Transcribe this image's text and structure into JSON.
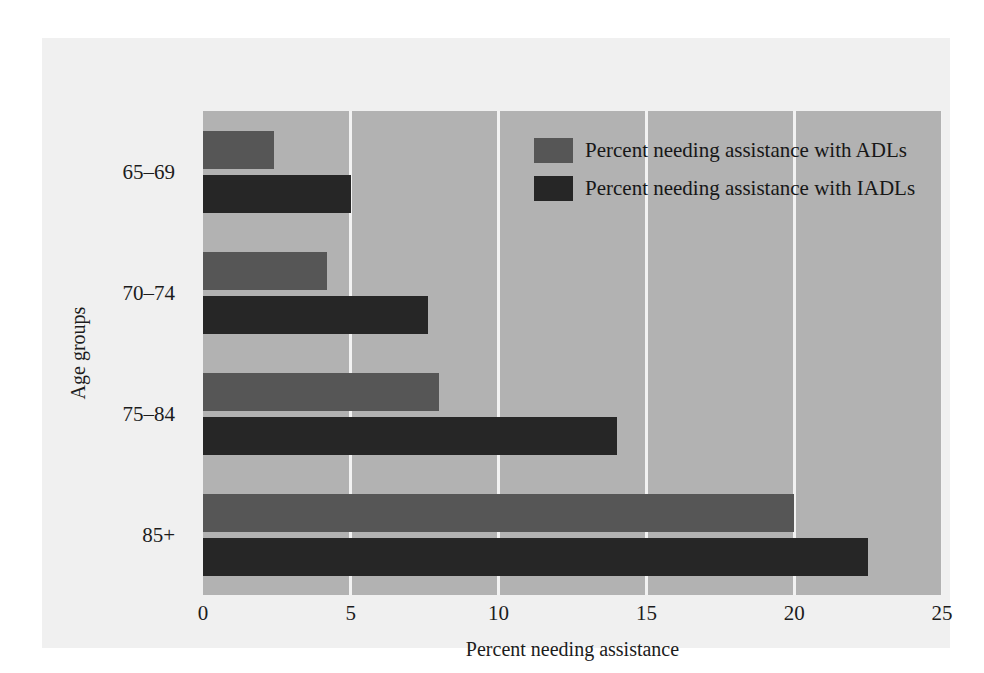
{
  "chart_data": {
    "type": "bar",
    "orientation": "horizontal",
    "title": "",
    "xlabel": "Percent needing assistance",
    "ylabel": "Age groups",
    "categories": [
      "65–69",
      "70–74",
      "75–84",
      "85+"
    ],
    "series": [
      {
        "name": "Percent needing assistance with ADLs",
        "color": "#565656",
        "values": [
          2.4,
          4.2,
          8.0,
          20.0
        ]
      },
      {
        "name": "Percent needing assistance with IADLs",
        "color": "#262626",
        "values": [
          5.0,
          7.6,
          14.0,
          22.5
        ]
      }
    ],
    "xlim": [
      0,
      25
    ],
    "xticks": [
      "0",
      "5",
      "10",
      "15",
      "20",
      "25"
    ],
    "xtick_values": [
      0,
      5,
      10,
      15,
      20,
      25
    ],
    "grid": "vertical",
    "legend_position": "top-right-inside",
    "plot_background": "#b2b2b2",
    "figure_background": "#f0f0f0",
    "gridline_color": "#f2f2f2"
  },
  "legend": {
    "items": [
      {
        "label": "Percent needing assistance with ADLs"
      },
      {
        "label": "Percent needing assistance with IADLs"
      }
    ]
  }
}
